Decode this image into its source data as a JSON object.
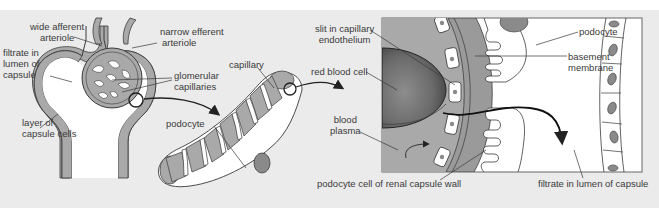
{
  "diagram": {
    "colors": {
      "background": "#ebebeb",
      "tissue_gray": "#a9a9a9",
      "cell_fill": "#ffffff",
      "nucleus": "#8a8a8a",
      "outline": "#3a3a3a",
      "label_text": "#3a3a3a"
    },
    "panel_1": {
      "name": "Bowman's capsule and glomerulus",
      "labels": {
        "wide_afferent": [
          "wide afferent",
          "arteriole"
        ],
        "narrow_efferent": [
          "narrow efferent",
          "arteriole"
        ],
        "filtrate": [
          "filtrate in",
          "lumen of",
          "capsule"
        ],
        "glomerular": [
          "glomerular",
          "capillaries"
        ],
        "capsule_cells": [
          "layer of",
          "capsule cells"
        ]
      }
    },
    "panel_2": {
      "name": "Podocyte wrapped around capillary",
      "labels": {
        "capillary": "capillary",
        "podocyte": "podocyte"
      }
    },
    "panel_3": {
      "name": "Filtration barrier detail",
      "labels": {
        "slit": [
          "slit in capillary",
          "endothelium"
        ],
        "rbc": "red blood cell",
        "plasma": [
          "blood",
          "plasma"
        ],
        "podocyte": "podocyte",
        "basement": [
          "basement",
          "membrane"
        ],
        "podocyte_wall": "podocyte cell of renal capsule wall",
        "filtrate_lumen": "filtrate in lumen of capsule"
      }
    }
  }
}
